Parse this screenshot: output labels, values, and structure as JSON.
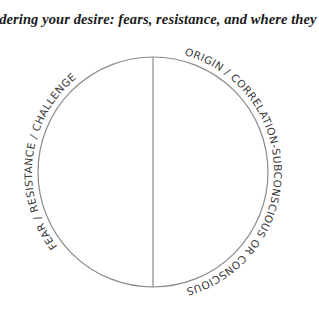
{
  "title": "Considering your desire: fears, resistance, and where they",
  "diagram": {
    "left_label": "FEAR / RESISTANCE / CHALLENGE",
    "right_label": "ORIGIN / CORRELATION-SUBCONSCIOUS OR CONSCIOUS",
    "stroke_color": "#8a8a8a",
    "text_color": "#3a3a3a"
  }
}
